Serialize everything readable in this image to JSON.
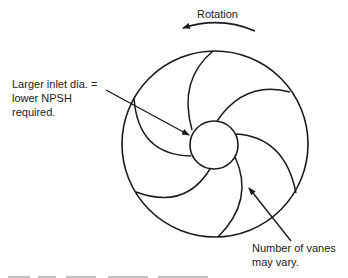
{
  "diagram": {
    "stroke_color": "#1a1a1a",
    "background_color": "#ffffff",
    "labels": {
      "rotation": "Rotation",
      "inlet": "Larger inlet dia. =\nlower NPSH\nrequired.",
      "vanes": "Number of vanes\nmay vary."
    },
    "impeller": {
      "outer_circle": {
        "cx": 215,
        "cy": 144,
        "r": 93
      },
      "hub_circle": {
        "cx": 214,
        "cy": 145,
        "r": 24
      },
      "vane_count": 6
    },
    "rotation_direction": "counter-clockwise"
  }
}
